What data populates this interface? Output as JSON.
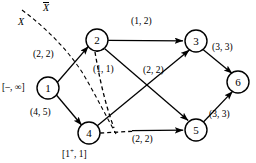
{
  "diagram": {
    "nodes": [
      {
        "id": "1",
        "label": "1",
        "cx": 48,
        "cy": 88,
        "r": 11
      },
      {
        "id": "2",
        "label": "2",
        "cx": 97,
        "cy": 40,
        "r": 11
      },
      {
        "id": "3",
        "label": "3",
        "cx": 196,
        "cy": 41,
        "r": 11
      },
      {
        "id": "4",
        "label": "4",
        "cx": 89,
        "cy": 133,
        "r": 11
      },
      {
        "id": "5",
        "label": "5",
        "cx": 196,
        "cy": 130,
        "r": 11
      },
      {
        "id": "6",
        "label": "6",
        "cx": 238,
        "cy": 82,
        "r": 11
      }
    ],
    "edges": [
      {
        "from": "1",
        "to": "2",
        "label": "(2, 2)",
        "style": "solid"
      },
      {
        "from": "1",
        "to": "4",
        "label": "(4, 5)",
        "style": "solid"
      },
      {
        "from": "2",
        "to": "3",
        "label": "(1, 2)",
        "style": "solid"
      },
      {
        "from": "2",
        "to": "5",
        "label": "(1, 1)",
        "style": "solid"
      },
      {
        "from": "4",
        "to": "3",
        "label": "(2, 2)",
        "style": "solid"
      },
      {
        "from": "4",
        "to": "5",
        "label": "(2, 2)",
        "style": "solid"
      },
      {
        "from": "3",
        "to": "6",
        "label": "(3, 3)",
        "style": "solid"
      },
      {
        "from": "5",
        "to": "6",
        "label": "(3, 3)",
        "style": "solid"
      }
    ],
    "edge_labels": {
      "e12": "(2, 2)",
      "e14": "(4, 5)",
      "e23": "(1, 2)",
      "e25": "(1, 1)",
      "e43": "(2, 2)",
      "e45": "(2, 2)",
      "e36": "(3, 3)",
      "e56": "(3, 3)"
    },
    "node_annotations": {
      "n1": "[–, ∞]",
      "n4_prefix": "[1",
      "n4_superscript": "+",
      "n4_suffix": ", 1]"
    },
    "cut_labels": {
      "inside": "X",
      "outside": "X"
    },
    "colors": {
      "stroke": "#000000",
      "background": "#ffffff"
    }
  }
}
